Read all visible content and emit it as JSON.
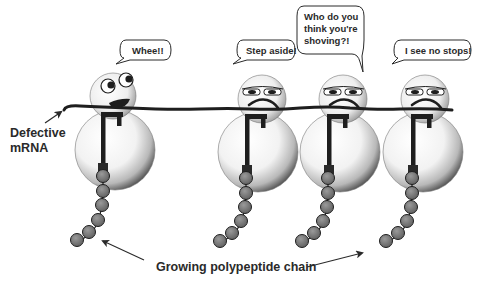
{
  "diagram": {
    "title": "",
    "colors": {
      "background": "#ffffff",
      "outline": "#1e1e1e",
      "ribosome_light": "#ffffff",
      "ribosome_dark": "#5a5a5a",
      "bead_fill": "#7a7a7a",
      "mrna": "#1e1e1e",
      "text": "#2a2a2a"
    },
    "labels": {
      "mrna_label_line1": "Defective",
      "mrna_label_line2": "mRNA",
      "chain_label": "Growing polypeptide chain"
    },
    "ribosomes": [
      {
        "id": "ribosome-1",
        "expression": "happy",
        "speech": [
          "Whee!!"
        ]
      },
      {
        "id": "ribosome-2",
        "expression": "annoyed",
        "speech": [
          "Step aside!"
        ]
      },
      {
        "id": "ribosome-3",
        "expression": "annoyed",
        "speech": [
          "Who do you",
          "think you're",
          "shoving?!"
        ]
      },
      {
        "id": "ribosome-4",
        "expression": "annoyed",
        "speech": [
          "I see no stops!"
        ]
      }
    ],
    "beads_per_chain": 6
  }
}
